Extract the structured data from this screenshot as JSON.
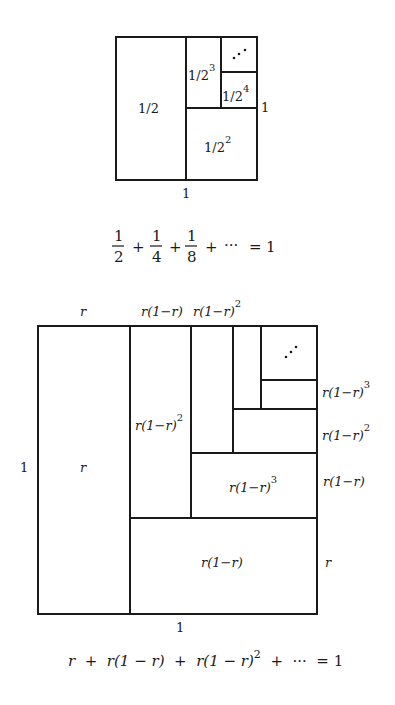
{
  "figure_top": {
    "labels": {
      "half": "1/2",
      "quarter_base": "1/2",
      "quarter_exp": "2",
      "eighth_base": "1/2",
      "eighth_exp": "3",
      "sixteenth_base": "1/2",
      "sixteenth_exp": "4",
      "ellipsis": "⋰",
      "right_side": "1",
      "bottom_side": "1"
    },
    "equation": {
      "term1_num": "1",
      "term1_den": "2",
      "term2_num": "1",
      "term2_den": "4",
      "term3_num": "1",
      "term3_den": "8",
      "plus": "+",
      "dots": "···",
      "equals": "=",
      "rhs": "1"
    }
  },
  "figure_bottom": {
    "top_labels": {
      "col1": "r",
      "col2": "r(1−r)",
      "col3_base": "r(1−r)",
      "col3_exp": "2"
    },
    "left_label": "1",
    "bottom_label": "1",
    "inner_labels": {
      "big_left": "r",
      "col2_base": "r(1−r)",
      "col2_exp": "2",
      "mid_base": "r(1−r)",
      "mid_exp": "3",
      "bottom_rect": "r(1−r)",
      "ellipsis": "⋰"
    },
    "right_labels": {
      "row1_base": "r(1−r)",
      "row1_exp": "3",
      "row2_base": "r(1−r)",
      "row2_exp": "2",
      "row3": "r(1−r)",
      "row4": "r"
    },
    "equation": "r  +  r(1 − r)  +  r(1 − r)",
    "equation_exp": "2",
    "equation_tail": "  +  ···  = 1"
  }
}
